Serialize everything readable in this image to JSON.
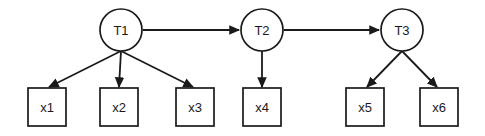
{
  "diagram": {
    "type": "path-diagram",
    "background_color": "#ffffff",
    "stroke_color": "#1a1a1a",
    "fill_color": "#ffffff",
    "latent_nodes": [
      {
        "id": "T1",
        "label": "T1",
        "shape": "circle",
        "cx": 121,
        "cy": 30,
        "r": 21
      },
      {
        "id": "T2",
        "label": "T2",
        "shape": "circle",
        "cx": 262,
        "cy": 30,
        "r": 21
      },
      {
        "id": "T3",
        "label": "T3",
        "shape": "circle",
        "cx": 402,
        "cy": 30,
        "r": 21
      }
    ],
    "observed_nodes": [
      {
        "id": "x1",
        "label": "x1",
        "shape": "rect",
        "x": 28,
        "y": 88,
        "w": 38,
        "h": 38
      },
      {
        "id": "x2",
        "label": "x2",
        "shape": "rect",
        "x": 100,
        "y": 88,
        "w": 38,
        "h": 38
      },
      {
        "id": "x3",
        "label": "x3",
        "shape": "rect",
        "x": 176,
        "y": 88,
        "w": 38,
        "h": 38
      },
      {
        "id": "x4",
        "label": "x4",
        "shape": "rect",
        "x": 243,
        "y": 88,
        "w": 38,
        "h": 38
      },
      {
        "id": "x5",
        "label": "x5",
        "shape": "rect",
        "x": 346,
        "y": 88,
        "w": 38,
        "h": 38
      },
      {
        "id": "x6",
        "label": "x6",
        "shape": "rect",
        "x": 420,
        "y": 88,
        "w": 38,
        "h": 38
      }
    ],
    "edges": [
      {
        "id": "T1-T2",
        "from": "T1",
        "to": "T2",
        "kind": "structural",
        "x1": 143,
        "y1": 30,
        "x2": 239,
        "y2": 30
      },
      {
        "id": "T2-T3",
        "from": "T2",
        "to": "T3",
        "kind": "structural",
        "x1": 284,
        "y1": 30,
        "x2": 379,
        "y2": 30
      },
      {
        "id": "T1-x1",
        "from": "T1",
        "to": "x1",
        "kind": "loading",
        "x1": 121,
        "y1": 51,
        "x2": 49,
        "y2": 87
      },
      {
        "id": "T1-x2",
        "from": "T1",
        "to": "x2",
        "kind": "loading",
        "x1": 121,
        "y1": 51,
        "x2": 119,
        "y2": 87
      },
      {
        "id": "T1-x3",
        "from": "T1",
        "to": "x3",
        "kind": "loading",
        "x1": 121,
        "y1": 51,
        "x2": 193,
        "y2": 87
      },
      {
        "id": "T2-x4",
        "from": "T2",
        "to": "x4",
        "kind": "loading",
        "x1": 262,
        "y1": 51,
        "x2": 262,
        "y2": 87
      },
      {
        "id": "T3-x5",
        "from": "T3",
        "to": "x5",
        "kind": "loading",
        "x1": 402,
        "y1": 51,
        "x2": 367,
        "y2": 87
      },
      {
        "id": "T3-x6",
        "from": "T3",
        "to": "x6",
        "kind": "loading",
        "x1": 402,
        "y1": 51,
        "x2": 437,
        "y2": 87
      }
    ]
  }
}
